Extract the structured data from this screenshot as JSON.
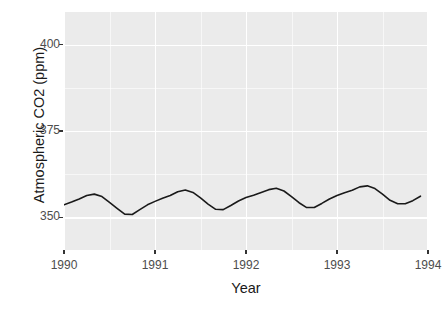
{
  "chart_data": {
    "type": "line",
    "title": "",
    "subtitle": "",
    "xlabel": "Year",
    "ylabel": "Atmospheric CO2 (ppm)",
    "xlim": [
      1990,
      1994
    ],
    "ylim": [
      340.5,
      409.5
    ],
    "xticks": [
      1990,
      1991,
      1992,
      1993,
      1994
    ],
    "xtick_labels": [
      "1990",
      "1991",
      "1992",
      "1993",
      "1994"
    ],
    "yticks": [
      350,
      375,
      400
    ],
    "ytick_labels": [
      "350",
      "375",
      "400"
    ],
    "grid": true,
    "grid_major_color": "#ffffff",
    "grid_minor_color": "#ffffff",
    "panel_color": "#ebebeb",
    "legend": "none",
    "line_color": "#1a1a1a",
    "line_width": 1.6,
    "series": [
      {
        "name": "Atmospheric CO2",
        "x": [
          1990.0,
          1990.083,
          1990.167,
          1990.25,
          1990.333,
          1990.417,
          1990.5,
          1990.583,
          1990.667,
          1990.75,
          1990.833,
          1990.917,
          1991.0,
          1991.083,
          1991.167,
          1991.25,
          1991.333,
          1991.417,
          1991.5,
          1991.583,
          1991.667,
          1991.75,
          1991.833,
          1991.917,
          1992.0,
          1992.083,
          1992.167,
          1992.25,
          1992.333,
          1992.417,
          1992.5,
          1992.583,
          1992.667,
          1992.75,
          1992.833,
          1992.917,
          1993.0,
          1993.083,
          1993.167,
          1993.25,
          1993.333,
          1993.417,
          1993.5,
          1993.583,
          1993.667,
          1993.75,
          1993.833,
          1993.917
        ],
        "y": [
          353.6,
          354.4,
          355.3,
          356.3,
          356.7,
          356.0,
          354.3,
          352.6,
          350.9,
          350.8,
          352.2,
          353.6,
          354.6,
          355.5,
          356.3,
          357.4,
          357.9,
          357.2,
          355.6,
          353.8,
          352.3,
          352.2,
          353.4,
          354.7,
          355.7,
          356.4,
          357.2,
          358.0,
          358.4,
          357.6,
          356.0,
          354.2,
          352.8,
          352.8,
          354.0,
          355.3,
          356.3,
          357.1,
          357.8,
          358.8,
          359.1,
          358.3,
          356.7,
          354.9,
          353.9,
          353.9,
          354.8,
          356.1
        ]
      }
    ]
  },
  "axes": {
    "y_ticks": [
      {
        "value": 400,
        "label": "400"
      },
      {
        "value": 375,
        "label": "375"
      },
      {
        "value": 350,
        "label": "350"
      }
    ],
    "x_ticks": [
      {
        "value": 1990,
        "label": "1990"
      },
      {
        "value": 1991,
        "label": "1991"
      },
      {
        "value": 1992,
        "label": "1992"
      },
      {
        "value": 1993,
        "label": "1993"
      },
      {
        "value": 1994,
        "label": "1994"
      }
    ],
    "x_title": "Year",
    "y_title": "Atmospheric CO2 (ppm)"
  },
  "background_showthrough": {
    "lines": [
      "the most regular geyser eruption intervals at",
      "Yellowstone National Park, Wyoming, United States",
      "take it to a public relations advantage of the show plan",
      "and these reasons here the"
    ]
  }
}
